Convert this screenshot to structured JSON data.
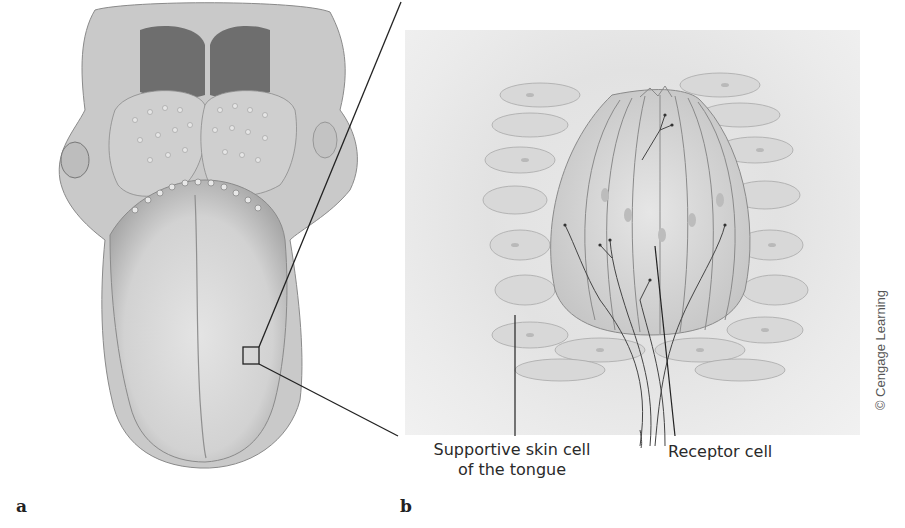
{
  "figure": {
    "panels": [
      {
        "letter": "a",
        "subject": "tongue-dorsal-view"
      },
      {
        "letter": "b",
        "subject": "taste-bud-closeup"
      }
    ],
    "labels": {
      "supportive_cell_line1": "Supportive skin cell",
      "supportive_cell_line2": "of the tongue",
      "receptor_cell": "Receptor cell"
    },
    "credit": "© Cengage Learning"
  }
}
